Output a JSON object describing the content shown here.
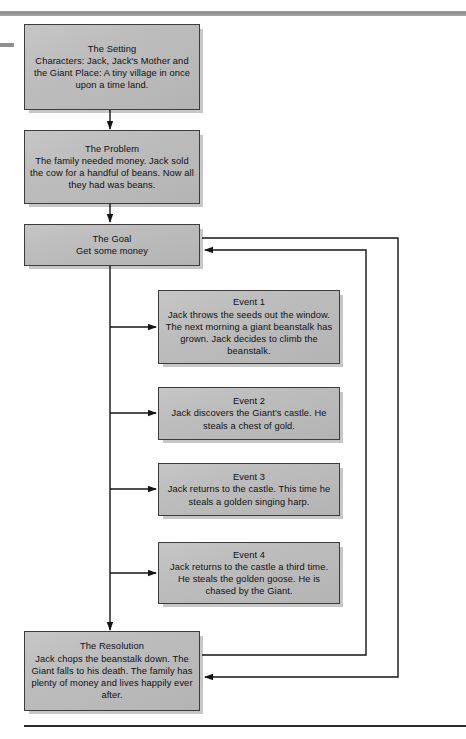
{
  "page": {
    "background_color": "#ffffff",
    "box_fill_color": "#bdbdbd",
    "box_border_color": "#3c3c3c",
    "line_color": "#1a1a1a",
    "top_rule_color": "#8e8e8e"
  },
  "boxes": {
    "setting": {
      "title": "The Setting",
      "body": "Characters: Jack, Jack's Mother and the Giant\nPlace: A tiny village in once upon a time land."
    },
    "problem": {
      "title": "The Problem",
      "body": "The family needed money. Jack sold the cow for a handful of beans. Now all they had was beans."
    },
    "goal": {
      "title": "The Goal",
      "body": "Get some money"
    },
    "event1": {
      "title": "Event 1",
      "body": "Jack throws the seeds out the window. The next morning a giant beanstalk has grown. Jack decides to climb the beanstalk."
    },
    "event2": {
      "title": "Event 2",
      "body": "Jack discovers the Giant's castle. He steals a chest of gold."
    },
    "event3": {
      "title": "Event 3",
      "body": "Jack returns to the castle. This time he steals a golden singing harp."
    },
    "event4": {
      "title": "Event 4",
      "body": "Jack returns to the castle a third time. He steals the golden goose. He is chased by the Giant."
    },
    "resolution": {
      "title": "The Resolution",
      "body": "Jack chops the beanstalk down. The Giant falls to his death. The family has plenty of money and lives happily ever after."
    }
  },
  "connectors": [
    {
      "name": "setting-to-problem",
      "from": "setting",
      "to": "problem",
      "kind": "arrow-down"
    },
    {
      "name": "problem-to-goal",
      "from": "problem",
      "to": "goal",
      "kind": "arrow-down"
    },
    {
      "name": "goal-to-event1",
      "from": "goal",
      "to": "event1",
      "kind": "arrow-right"
    },
    {
      "name": "goal-to-event2",
      "from": "goal",
      "to": "event2",
      "kind": "arrow-right"
    },
    {
      "name": "goal-to-event3",
      "from": "goal",
      "to": "event3",
      "kind": "arrow-right"
    },
    {
      "name": "goal-to-event4",
      "from": "goal",
      "to": "event4",
      "kind": "arrow-right"
    },
    {
      "name": "goal-to-resolution",
      "from": "goal",
      "to": "resolution",
      "kind": "arrow-down"
    },
    {
      "name": "resolution-to-goal-feedback",
      "from": "resolution",
      "to": "goal",
      "kind": "arrow-loop-left"
    },
    {
      "name": "goal-to-resolution-feedback",
      "from": "goal",
      "to": "resolution",
      "kind": "arrow-loop-right"
    }
  ]
}
